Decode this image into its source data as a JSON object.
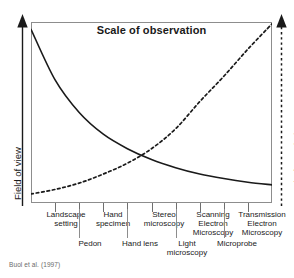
{
  "figure": {
    "title": "Scale of observation",
    "citation": "Buol et al. (1997)",
    "axis_left_title": "Field of view",
    "axis_right_title": "Level of Resolution"
  },
  "chart_data": {
    "type": "line",
    "title": "Scale of observation",
    "subtitle": "",
    "xlabel": "",
    "ylabel": "Field of view",
    "y2label": "Level of Resolution",
    "grid": false,
    "legend": "none",
    "axis_note": "Both vertical axes are qualitative arrows (increasing upward); no numeric tick labels are shown.",
    "xlim": [
      0,
      10
    ],
    "ylim": [
      0,
      10
    ],
    "categories": [
      "Landscape setting",
      "Pedon",
      "Hand specimen",
      "Hand lens",
      "Stereo microscopy",
      "Light microscopy",
      "Scanning Electron Microscopy",
      "Microprobe",
      "Transmission Electron Microscopy"
    ],
    "crossing_point": {
      "x": 4.75,
      "y": 2.6
    },
    "series": [
      {
        "name": "Field of view",
        "style": "solid",
        "color": "#1a1a1a",
        "trend": "decreasing exponential decay",
        "x": [
          0,
          1,
          2,
          3,
          4,
          5,
          6,
          7,
          8,
          9,
          10
        ],
        "values": [
          9.6,
          6.8,
          5.0,
          3.8,
          3.0,
          2.4,
          1.95,
          1.6,
          1.35,
          1.15,
          1.0
        ]
      },
      {
        "name": "Level of Resolution",
        "style": "dashed",
        "color": "#1a1a1a",
        "trend": "increasing exponential growth",
        "x": [
          0,
          1,
          2,
          3,
          4,
          5,
          6,
          7,
          8,
          9,
          10
        ],
        "values": [
          0.5,
          0.75,
          1.1,
          1.6,
          2.2,
          3.0,
          4.1,
          5.6,
          7.0,
          8.5,
          9.9
        ]
      }
    ]
  },
  "xaxis": {
    "tick_count": 10,
    "primary_labels": [
      {
        "text": "Landscape\nsetting",
        "center": 66,
        "width": 60
      },
      {
        "text": "Hand\nspecimen",
        "center": 113,
        "width": 54
      },
      {
        "text": "Stereo\nmicroscopy",
        "center": 164,
        "width": 58
      },
      {
        "text": "Scanning\nElectron\nMicroscopy",
        "center": 213,
        "width": 58
      },
      {
        "text": "Transmission\nElectron\nMicroscopy",
        "center": 262,
        "width": 62
      }
    ],
    "secondary_labels": [
      {
        "text": "Pedon",
        "center": 90,
        "width": 44
      },
      {
        "text": "Hand lens",
        "center": 140,
        "width": 52
      },
      {
        "text": "Light\nmicroscopy",
        "center": 187,
        "width": 52
      },
      {
        "text": "Microprobe",
        "center": 237,
        "width": 56
      }
    ]
  }
}
